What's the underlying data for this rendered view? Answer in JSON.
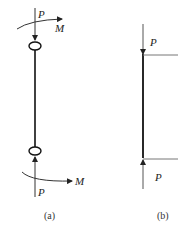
{
  "diagram": {
    "panel_a": {
      "caption": "(a)",
      "top_force_label": "P",
      "top_moment_label": "M",
      "bottom_force_label": "P",
      "bottom_moment_label": "M"
    },
    "panel_b": {
      "caption": "(b)",
      "top_force_label": "P",
      "bottom_force_label": "P"
    },
    "colors": {
      "line": "#222222",
      "thin_line": "#777777"
    }
  }
}
